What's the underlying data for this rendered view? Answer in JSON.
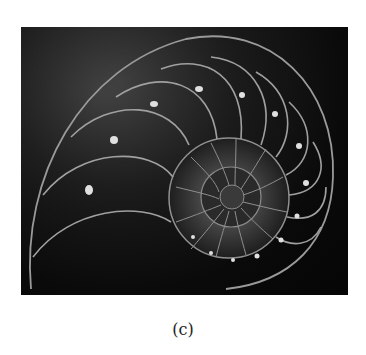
{
  "figure": {
    "caption": "(c)",
    "image": {
      "subject": "nautilus-shell-cross-section",
      "background_color": "#0a0a0a",
      "line_color": "#a8a8a8"
    }
  }
}
